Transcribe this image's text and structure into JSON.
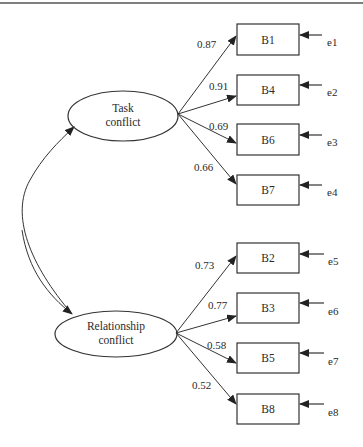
{
  "diagram": {
    "type": "confirmatory factor analysis path diagram",
    "top_rule": true,
    "latent_factors": [
      {
        "id": "task",
        "label_lines": [
          "Task",
          "conflict"
        ],
        "indicators": [
          {
            "label": "B1",
            "loading": "0.87",
            "error": "e1"
          },
          {
            "label": "B4",
            "loading": "0.91",
            "error": "e2"
          },
          {
            "label": "B6",
            "loading": "0.69",
            "error": "e3"
          },
          {
            "label": "B7",
            "loading": "0.66",
            "error": "e4"
          }
        ]
      },
      {
        "id": "relationship",
        "label_lines": [
          "Relationship",
          "conflict"
        ],
        "indicators": [
          {
            "label": "B2",
            "loading": "0.73",
            "error": "e5"
          },
          {
            "label": "B3",
            "loading": "0.77",
            "error": "e6"
          },
          {
            "label": "B5",
            "loading": "0.58",
            "error": "e7"
          },
          {
            "label": "B8",
            "loading": "0.52",
            "error": "e8"
          }
        ]
      }
    ],
    "covariance": {
      "between": [
        "Task conflict",
        "Relationship conflict"
      ],
      "label": ""
    },
    "colors": {
      "line": "#333333",
      "text": "#2a2a2a",
      "background": "#ffffff"
    }
  }
}
